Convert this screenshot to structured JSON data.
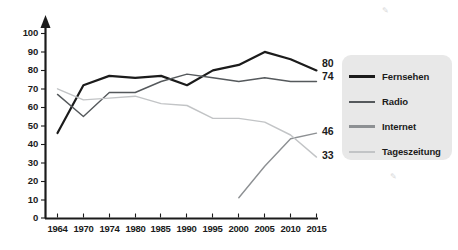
{
  "chart_data": {
    "type": "line",
    "title": "",
    "subtitle": "",
    "xlabel": "",
    "ylabel": "",
    "categories": [
      "1964",
      "1970",
      "1974",
      "1980",
      "1985",
      "1990",
      "1995",
      "2000",
      "2005",
      "2010",
      "2015"
    ],
    "ylim": [
      0,
      100
    ],
    "xlim_categories": [
      0,
      10
    ],
    "ytick_labels": [
      "0",
      "10",
      "20",
      "30",
      "40",
      "50",
      "60",
      "70",
      "80",
      "90",
      "100"
    ],
    "ytick_values": [
      0,
      10,
      20,
      30,
      40,
      50,
      60,
      70,
      80,
      90,
      100
    ],
    "grid": false,
    "legend_position": "right",
    "axis_style": "y-axis-with-arrow",
    "series": [
      {
        "name": "Fernsehen",
        "color": "#1b1b1b",
        "width": 2.2,
        "values": [
          46,
          72,
          77,
          76,
          77,
          72,
          80,
          83,
          90,
          86,
          80
        ],
        "end_label": "80"
      },
      {
        "name": "Radio",
        "color": "#55595c",
        "width": 1.4,
        "values": [
          67,
          55,
          68,
          68,
          74,
          78,
          76,
          74,
          76,
          74,
          74
        ],
        "end_label": "74"
      },
      {
        "name": "Internet",
        "color": "#8d9093",
        "width": 1.4,
        "values": [
          null,
          null,
          null,
          null,
          null,
          null,
          null,
          11,
          28,
          43,
          46
        ],
        "end_label": "46"
      },
      {
        "name": "Tageszeitung",
        "color": "#c2c4c6",
        "width": 1.4,
        "values": [
          70,
          64,
          65,
          66,
          62,
          61,
          54,
          54,
          52,
          45,
          33
        ],
        "end_label": "33"
      }
    ],
    "end_labels": [
      {
        "text": "80",
        "series": "Fernsehen"
      },
      {
        "text": "74",
        "series": "Radio"
      },
      {
        "text": "46",
        "series": "Internet"
      },
      {
        "text": "33",
        "series": "Tageszeitung"
      }
    ]
  },
  "legend": {
    "background_color": "#e8e8e8",
    "items": [
      {
        "label": "Fernsehen",
        "color": "#1b1b1b",
        "thickness": "3px"
      },
      {
        "label": "Radio",
        "color": "#55595c",
        "thickness": "2px"
      },
      {
        "label": "Internet",
        "color": "#8d9093",
        "thickness": "2.5px"
      },
      {
        "label": "Tageszeitung",
        "color": "#c2c4c6",
        "thickness": "2px"
      }
    ]
  }
}
